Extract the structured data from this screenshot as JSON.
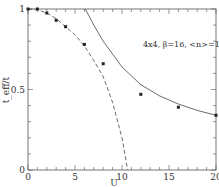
{
  "chart_data": {
    "type": "line",
    "title": "",
    "annotation": "4x4, β=16, <n>=1",
    "xlabel": "U",
    "ylabel": "t_eff/t",
    "xlim": [
      0,
      20
    ],
    "ylim": [
      0,
      1
    ],
    "x_ticks": [
      "0",
      "5",
      "10",
      "15",
      "20"
    ],
    "y_ticks": [
      "0",
      "0.5",
      "1"
    ],
    "grid": false,
    "legend": null,
    "series": [
      {
        "name": "data points",
        "style": "markers",
        "x": [
          0,
          1,
          2,
          3,
          4,
          6,
          8,
          12,
          16,
          20
        ],
        "y": [
          1.0,
          1.0,
          0.975,
          0.93,
          0.89,
          0.78,
          0.66,
          0.47,
          0.39,
          0.34
        ]
      },
      {
        "name": "small-U (dashed)",
        "style": "dashed",
        "x": [
          0,
          1,
          2,
          3,
          4,
          5,
          6,
          7,
          8,
          9,
          10,
          10.6
        ],
        "y": [
          1.0,
          0.995,
          0.975,
          0.94,
          0.89,
          0.84,
          0.77,
          0.68,
          0.58,
          0.42,
          0.2,
          0.0
        ]
      },
      {
        "name": "large-U (solid)",
        "style": "solid",
        "x": [
          6.1,
          7,
          8,
          10,
          12,
          14,
          16,
          18,
          20
        ],
        "y": [
          1.0,
          0.9,
          0.8,
          0.64,
          0.53,
          0.46,
          0.41,
          0.37,
          0.34
        ]
      }
    ]
  }
}
